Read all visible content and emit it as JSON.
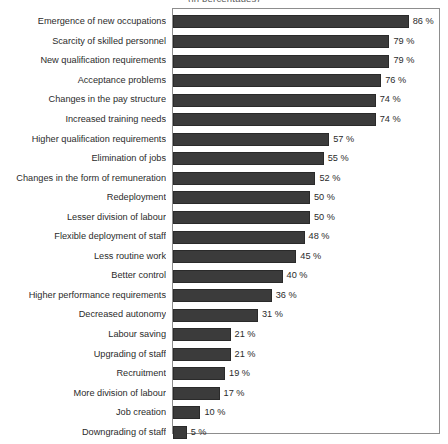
{
  "chart_data": {
    "type": "bar",
    "orientation": "horizontal",
    "title": "(in percentages)",
    "xlabel": "",
    "ylabel": "",
    "xlim": [
      0,
      100
    ],
    "grid": false,
    "legend": null,
    "value_suffix": "%",
    "bar_color": "#3b3b3b",
    "frame_color": "#8d8d8d",
    "categories": [
      "Emergence of new occupations",
      "Scarcity of skilled personnel",
      "New qualification requirements",
      "Acceptance problems",
      "Changes in the pay structure",
      "Increased training needs",
      "Higher qualification requirements",
      "Elimination of jobs",
      "Changes in the form of remuneration",
      "Redeployment",
      "Lesser division of labour",
      "Flexible deployment of staff",
      "Less routine work",
      "Better control",
      "Higher performance requirements",
      "Decreased autonomy",
      "Labour saving",
      "Upgrading of staff",
      "Recruitment",
      "More division of labour",
      "Job creation",
      "Downgrading of staff"
    ],
    "values": [
      86,
      79,
      79,
      76,
      74,
      74,
      57,
      55,
      52,
      50,
      50,
      48,
      45,
      40,
      36,
      31,
      21,
      21,
      19,
      17,
      10,
      5
    ],
    "value_labels": [
      "86 %",
      "79 %",
      "79 %",
      "76 %",
      "74 %",
      "74 %",
      "57 %",
      "55 %",
      "52 %",
      "50 %",
      "50 %",
      "48 %",
      "45 %",
      "40 %",
      "36 %",
      "31 %",
      "21 %",
      "21 %",
      "19 %",
      "17 %",
      "10 %",
      "5 %"
    ]
  }
}
